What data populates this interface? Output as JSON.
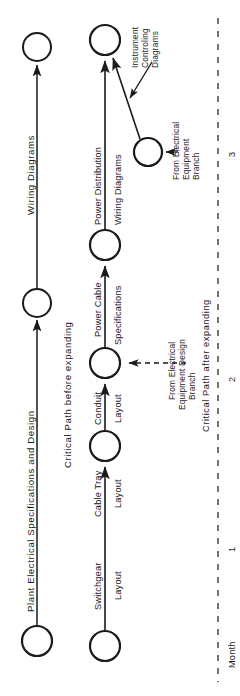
{
  "diagram": {
    "type": "pert-network",
    "orientation": "rotated-90-ccw",
    "stroke_color": "#1a1a1a",
    "background_color": "#ffffff"
  },
  "nodes": [
    {
      "id": "n1",
      "name": "top-left-node",
      "cx": 37,
      "cy": 47,
      "r": 14
    },
    {
      "id": "n2",
      "name": "upper-left-node",
      "cx": 37,
      "cy": 303,
      "r": 14
    },
    {
      "id": "n3",
      "name": "bottom-left-start-node",
      "cx": 37,
      "cy": 641,
      "r": 15
    },
    {
      "id": "n4",
      "name": "top-right-node",
      "cx": 105,
      "cy": 40,
      "r": 15
    },
    {
      "id": "n5",
      "name": "power-cable-node",
      "cx": 105,
      "cy": 245,
      "r": 15
    },
    {
      "id": "n6",
      "name": "conduit-layout-node",
      "cx": 105,
      "cy": 363,
      "r": 15
    },
    {
      "id": "n7",
      "name": "cable-tray-node",
      "cx": 105,
      "cy": 446,
      "r": 15
    },
    {
      "id": "n8",
      "name": "switchgear-start-node",
      "cx": 105,
      "cy": 646,
      "r": 15
    },
    {
      "id": "n9",
      "name": "electrical-equipment-branch-node",
      "cx": 148,
      "cy": 152,
      "r": 14
    }
  ],
  "edges": [
    {
      "name": "edge-plant-electrical-specifications",
      "label": "Plant  Electrical  Specifications  and  Design"
    },
    {
      "name": "edge-wiring-diagrams-left",
      "label": "Wiring  Diagrams"
    },
    {
      "name": "edge-switchgear-layout",
      "label_1": "Switchgear",
      "label_2": "Layout"
    },
    {
      "name": "edge-cable-tray-layout",
      "label_1": "Cable  Tray",
      "label_2": "Layout"
    },
    {
      "name": "edge-conduit-layout",
      "label_1": "Conduit",
      "label_2": "Layout"
    },
    {
      "name": "edge-power-cable-specifications",
      "label_1": "Power  Cable",
      "label_2": "Specifications"
    },
    {
      "name": "edge-power-distribution-wiring-diagrams",
      "label_1": "Power Distribution",
      "label_2": "Wiring Diagrams"
    },
    {
      "name": "edge-instrument-controling-diagrams",
      "label_1": "Instrument",
      "label_2": "Controling",
      "label_3": "Diagrams"
    }
  ],
  "annotations": {
    "critical_path_before": "Critical  Path  before  expanding",
    "critical_path_after": "Critical  Path  after expanding",
    "from_electrical_equipment_design_branch": {
      "line1": "From Electrical",
      "line2": "Equipment Design",
      "line3": "Branch"
    },
    "from_electrical_equipment_branch": {
      "line1": "From Electrical",
      "line2": "Equipment",
      "line3": "Branch"
    },
    "instrument_controling_diagrams": {
      "line1": "Instrument",
      "line2": "Controling",
      "line3": "Diagrams"
    }
  },
  "timescale": {
    "axis_name": "month-axis",
    "axis_label": "Month",
    "ticks": [
      "1",
      "2",
      "3"
    ]
  }
}
